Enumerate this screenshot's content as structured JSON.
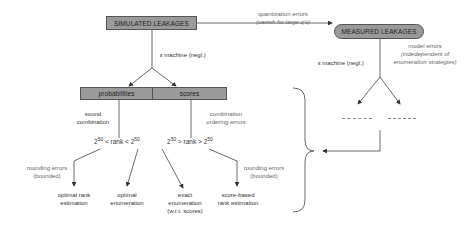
{
  "nodes": {
    "simulated": "SIMULATED LEAKAGES",
    "measured": "MEASURED LEAKAGES",
    "probabilities": "probabilities",
    "scores": "scores"
  },
  "edge_labels": {
    "quantization_errors": "quantization errors",
    "quantization_note": "(vanish for large q's)",
    "machine_left": "ε machine (negl.)",
    "machine_right": "ε machine (negl.)",
    "model_errors": "model errors",
    "model_note_1": "(indedependent of",
    "model_note_2": "enumeration strategies)",
    "sound_1": "sound",
    "sound_2": "combination",
    "combination_1": "combination",
    "combination_2": "ordering errors",
    "rounding_left_1": "rounding errors",
    "rounding_left_2": "(bounded)",
    "rounding_right_1": "rounding errors",
    "rounding_right_2": "(bounded)"
  },
  "conditions": {
    "left": {
      "base1": "2",
      "exp1": "50",
      "mid": " < rank < ",
      "base2": "2",
      "exp2": "50"
    },
    "right": {
      "base1": "2",
      "exp1": "50",
      "mid": " > rank > ",
      "base2": "2",
      "exp2": "50"
    }
  },
  "outcomes": {
    "optimal_rank_1": "optimal rank",
    "optimal_rank_2": "estimation",
    "optimal_enum_1": "optimal",
    "optimal_enum_2": "enumeration",
    "exact_1": "exact",
    "exact_2": "enumeration",
    "exact_3": "(w.r.t. scores)",
    "score_based_1": "score-based",
    "score_based_2": "rank estimation"
  },
  "colors": {
    "box_fill": "#9a9a9a",
    "line": "#444444",
    "label": "#666666"
  }
}
